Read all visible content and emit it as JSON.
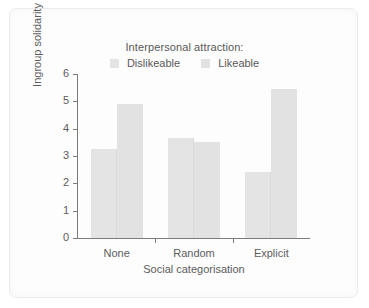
{
  "chart_data": {
    "type": "bar",
    "title": "",
    "legend_title": "Interpersonal attraction:",
    "legend_position": "top-center",
    "categories": [
      "None",
      "Random",
      "Explicit"
    ],
    "series": [
      {
        "name": "Dislikeable",
        "color": "#e4e4e4",
        "values": [
          3.25,
          3.65,
          2.4
        ]
      },
      {
        "name": "Likeable",
        "color": "#e2e2e2",
        "values": [
          4.9,
          3.5,
          5.45
        ]
      }
    ],
    "xlabel": "Social categorisation",
    "ylabel": "Ingroup solidarity",
    "ylim": [
      0,
      6
    ],
    "yticks": [
      0,
      1,
      2,
      3,
      4,
      5,
      6
    ],
    "ytick_labels": [
      "0",
      "1",
      "2",
      "3",
      "4",
      "5",
      "6"
    ],
    "grid": false
  },
  "colors": {
    "axis": "#7b7b7b",
    "text": "#5c5c5c",
    "background": "#ffffff",
    "frame": "#ececec",
    "bar_dislikeable": "#e4e4e4",
    "bar_likeable": "#e2e2e2"
  }
}
